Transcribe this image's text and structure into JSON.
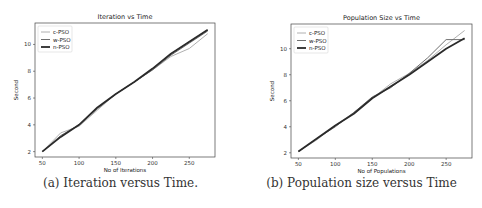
{
  "chart_data": [
    {
      "type": "line",
      "title": "Iteration vs Time",
      "xlabel": "No of Iterations",
      "ylabel": "Second",
      "xlim": [
        40,
        285
      ],
      "ylim": [
        1.6,
        11.6
      ],
      "xticks": [
        50,
        100,
        150,
        200,
        250
      ],
      "yticks": [
        2,
        4,
        6,
        8,
        10
      ],
      "legend": "top-left",
      "grid": false,
      "x": [
        50,
        75,
        100,
        125,
        150,
        175,
        200,
        225,
        250,
        275
      ],
      "series": [
        {
          "name": "c-PSO",
          "color": "#b0b0b0",
          "values": [
            2.0,
            3.4,
            3.9,
            5.1,
            6.3,
            7.2,
            8.1,
            9.1,
            9.7,
            10.8
          ]
        },
        {
          "name": "w-PSO",
          "color": "#707070",
          "values": [
            2.0,
            3.2,
            4.0,
            5.2,
            6.3,
            7.2,
            8.1,
            9.2,
            10.1,
            11.0
          ]
        },
        {
          "name": "n-PSO",
          "color": "#2a2a2a",
          "values": [
            2.0,
            3.1,
            4.0,
            5.3,
            6.3,
            7.2,
            8.2,
            9.3,
            10.2,
            11.1
          ]
        }
      ],
      "caption": "(a) Iteration versus Time."
    },
    {
      "type": "line",
      "title": "Population Size vs Time",
      "xlabel": "No of Populations",
      "ylabel": "Second",
      "xlim": [
        40,
        285
      ],
      "ylim": [
        1.6,
        11.9
      ],
      "xticks": [
        50,
        100,
        150,
        200,
        250
      ],
      "yticks": [
        2,
        4,
        6,
        8,
        10
      ],
      "legend": "top-left",
      "grid": false,
      "x": [
        50,
        75,
        100,
        125,
        150,
        175,
        200,
        225,
        250,
        275
      ],
      "series": [
        {
          "name": "c-PSO",
          "color": "#b0b0b0",
          "values": [
            2.1,
            3.0,
            4.1,
            5.1,
            6.2,
            7.3,
            8.1,
            9.1,
            10.3,
            11.4
          ]
        },
        {
          "name": "w-PSO",
          "color": "#707070",
          "values": [
            2.1,
            3.1,
            4.0,
            5.1,
            6.3,
            7.0,
            8.1,
            9.3,
            10.7,
            10.7
          ]
        },
        {
          "name": "n-PSO",
          "color": "#2a2a2a",
          "values": [
            2.1,
            3.1,
            4.1,
            5.0,
            6.2,
            7.1,
            8.0,
            9.0,
            10.0,
            10.8
          ]
        }
      ],
      "caption": "(b) Population size versus Time"
    }
  ]
}
